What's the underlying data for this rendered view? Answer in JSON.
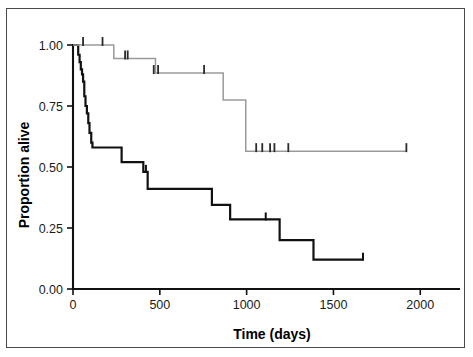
{
  "figure": {
    "has_border": true,
    "background_color": "#ffffff"
  },
  "chart_data": {
    "type": "line",
    "subtype": "kaplan-meier-survival",
    "title": "",
    "xlabel": "Time (days)",
    "ylabel": "Proportion alive",
    "xlim": [
      0,
      2200
    ],
    "ylim": [
      0,
      1.0
    ],
    "xticks": [
      0,
      500,
      1000,
      1500,
      2000
    ],
    "xticklabels": [
      "0",
      "500",
      "1000",
      "1500",
      "2000"
    ],
    "yticks": [
      0.0,
      0.25,
      0.5,
      0.75,
      1.0
    ],
    "yticklabels": [
      "0.00",
      "0.25",
      "0.50",
      "0.75",
      "1.00"
    ],
    "grid": false,
    "legend": false,
    "legend_position": "none",
    "series": [
      {
        "name": "Lower survival group",
        "color": "#111111",
        "style": "step-post",
        "line_width": 2.2,
        "x": [
          0,
          20,
          30,
          38,
          45,
          52,
          58,
          65,
          72,
          80,
          88,
          95,
          105,
          112,
          255,
          280,
          390,
          405,
          420,
          430,
          790,
          800,
          890,
          905,
          1175,
          1190,
          1370,
          1385,
          1670
        ],
        "y": [
          1.0,
          1.0,
          0.96,
          0.93,
          0.9,
          0.88,
          0.85,
          0.79,
          0.75,
          0.72,
          0.68,
          0.64,
          0.6,
          0.58,
          0.58,
          0.52,
          0.52,
          0.48,
          0.48,
          0.41,
          0.41,
          0.345,
          0.345,
          0.285,
          0.285,
          0.2,
          0.2,
          0.12,
          0.12
        ],
        "censored_x": [
          420,
          1110,
          1670
        ],
        "censored_y": [
          0.48,
          0.285,
          0.12
        ]
      },
      {
        "name": "Higher survival group",
        "color": "#9a9a9a",
        "style": "step-post",
        "line_width": 1.5,
        "x": [
          0,
          225,
          235,
          465,
          475,
          855,
          865,
          985,
          995,
          1920
        ],
        "y": [
          1.0,
          1.0,
          0.945,
          0.945,
          0.885,
          0.885,
          0.775,
          0.775,
          0.565,
          0.565
        ],
        "censored_x": [
          58,
          170,
          300,
          315,
          465,
          490,
          755,
          1055,
          1090,
          1135,
          1160,
          1240,
          1920
        ],
        "censored_y": [
          1.0,
          1.0,
          0.945,
          0.945,
          0.885,
          0.885,
          0.885,
          0.565,
          0.565,
          0.565,
          0.565,
          0.565,
          0.565
        ]
      }
    ],
    "censor_marker": "vertical-tick"
  },
  "axes": {
    "x_title": "Time (days)",
    "y_title": "Proportion alive"
  }
}
